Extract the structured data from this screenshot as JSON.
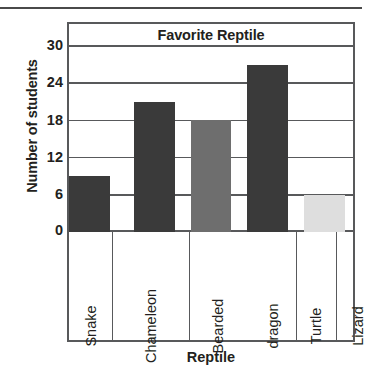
{
  "chart_data": {
    "type": "bar",
    "title": "Favorite Reptile",
    "xlabel": "Reptile",
    "ylabel": "Number of students",
    "categories": [
      "Snake",
      "Chameleon",
      "Bearded dragon",
      "Turtle",
      "Lizard"
    ],
    "category_lines": [
      [
        "Snake"
      ],
      [
        "Chameleon"
      ],
      [
        "Bearded",
        "dragon"
      ],
      [
        "Turtle"
      ],
      [
        "Lizard"
      ]
    ],
    "values": [
      9,
      21,
      18,
      27,
      6
    ],
    "ylim": [
      0,
      30
    ],
    "yticks": [
      0,
      6,
      12,
      18,
      24,
      30
    ],
    "ytick_labels": [
      "0",
      "6",
      "12",
      "18",
      "24",
      "30"
    ],
    "grid": true,
    "legend": false,
    "bar_colors": [
      "#3a3a3a",
      "#3a3a3a",
      "#6e6e6e",
      "#3a3a3a",
      "#dedede"
    ]
  },
  "colors": {
    "axis": "#58595b",
    "text": "#231f20",
    "background": "#ffffff"
  }
}
